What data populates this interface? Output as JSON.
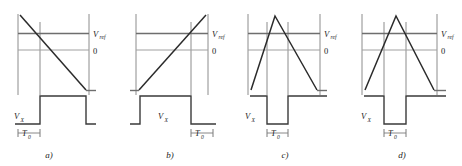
{
  "figure": {
    "background_color": "#ffffff",
    "ramp_color": "#2b2b2b",
    "ref_line_color": "#6e6e6e",
    "zero_line_color": "#9a9a9a",
    "frame_color": "#8c8c8c",
    "pulse_color": "#3a3a3a",
    "tick_color": "#7a7a7a"
  },
  "labels": {
    "v_ref_main": "V",
    "v_ref_sub": "ref",
    "zero": "0",
    "v_x_main": "V",
    "v_x_sub": "X",
    "t0_main": "T",
    "t0_sub": "0"
  },
  "panels": [
    {
      "id": "a",
      "caption": "a)",
      "ramp_shape": "falling-ramp",
      "pulse_shape": "high-pulse",
      "t0_position": "left",
      "vx_label_position": "left",
      "description": "Falling ramp crossing V_ref early; V_X pulse high during T0 window"
    },
    {
      "id": "b",
      "caption": "b)",
      "ramp_shape": "rising-ramp",
      "pulse_shape": "high-pulse",
      "t0_position": "right",
      "vx_label_position": "center",
      "description": "Rising ramp crossing V_ref late; V_X pulse high, T0 marked at right"
    },
    {
      "id": "c",
      "caption": "c)",
      "ramp_shape": "asymmetric-triangle",
      "pulse_shape": "low-pulse",
      "t0_position": "center",
      "vx_label_position": "left",
      "description": "Asymmetric triangle peaking early; V_X pulse low during narrow T0"
    },
    {
      "id": "d",
      "caption": "d)",
      "ramp_shape": "symmetric-triangle",
      "pulse_shape": "low-pulse",
      "t0_position": "center",
      "vx_label_position": "left",
      "description": "Symmetric triangle; V_X pulse low during centered T0"
    }
  ]
}
